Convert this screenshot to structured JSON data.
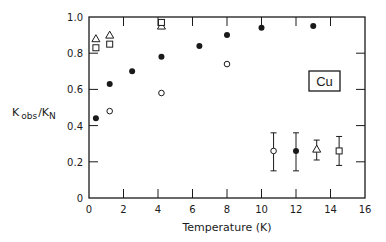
{
  "chart_data": {
    "type": "scatter",
    "title": "",
    "xlabel": "Temperature (K)",
    "ylabel": "K_obs / K_N",
    "ylabel_main": "K",
    "ylabel_sub1": "obs",
    "ylabel_slash": "/K",
    "ylabel_sub2": "N",
    "xlim": [
      0,
      16
    ],
    "ylim": [
      0,
      1.0
    ],
    "x_ticks": [
      0,
      2,
      4,
      6,
      8,
      10,
      12,
      14,
      16
    ],
    "y_ticks": [
      0,
      0.2,
      0.4,
      0.6,
      0.8,
      1.0
    ],
    "x_tick_labels": [
      "0",
      "2",
      "4",
      "6",
      "8",
      "10",
      "12",
      "14",
      "16"
    ],
    "y_tick_labels": [
      "0",
      "0.2",
      "0.4",
      "0.6",
      "0.8",
      "1.0"
    ],
    "grid": false,
    "annotation": "Cu",
    "series": [
      {
        "name": "filled-circle",
        "marker": "filled-circle",
        "x": [
          0.4,
          1.2,
          2.5,
          4.2,
          6.4,
          8.0,
          10.0,
          13.0
        ],
        "y": [
          0.44,
          0.63,
          0.7,
          0.78,
          0.84,
          0.9,
          0.94,
          0.95
        ]
      },
      {
        "name": "open-circle",
        "marker": "open-circle",
        "x": [
          1.2,
          4.2,
          8.0
        ],
        "y": [
          0.48,
          0.58,
          0.74
        ]
      },
      {
        "name": "open-triangle",
        "marker": "open-triangle",
        "x": [
          0.4,
          1.2,
          4.2
        ],
        "y": [
          0.88,
          0.9,
          0.95
        ]
      },
      {
        "name": "open-square",
        "marker": "open-square",
        "x": [
          0.4,
          1.2,
          4.2
        ],
        "y": [
          0.83,
          0.85,
          0.97
        ]
      }
    ],
    "error_points": [
      {
        "marker": "open-circle",
        "x": 10.7,
        "y": 0.26,
        "ylow": 0.15,
        "yhigh": 0.36
      },
      {
        "marker": "filled-circle",
        "x": 12.0,
        "y": 0.26,
        "ylow": 0.15,
        "yhigh": 0.36
      },
      {
        "marker": "open-triangle",
        "x": 13.2,
        "y": 0.27,
        "ylow": 0.21,
        "yhigh": 0.32
      },
      {
        "marker": "open-square",
        "x": 14.5,
        "y": 0.26,
        "ylow": 0.18,
        "yhigh": 0.34
      }
    ]
  },
  "colors": {
    "ink": "#1a1a1a",
    "background": "#ffffff"
  }
}
